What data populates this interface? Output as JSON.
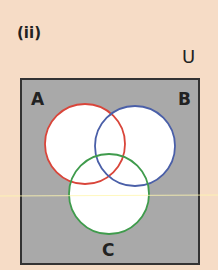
{
  "part_label": "(ii)",
  "universal_symbol": "U",
  "sets": [
    {
      "name": "A",
      "color": "#d9453a"
    },
    {
      "name": "B",
      "color": "#4a5fa8"
    },
    {
      "name": "C",
      "color": "#3f9b4c"
    }
  ],
  "colors": {
    "background": "#f6dcc6",
    "shaded": "#a9a9a9",
    "circle_fill": "#ffffff"
  }
}
